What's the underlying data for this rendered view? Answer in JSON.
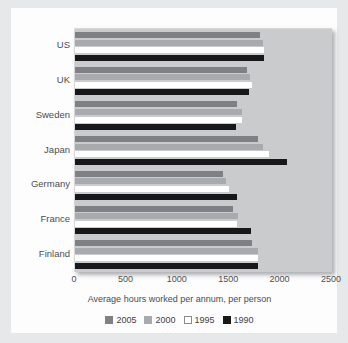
{
  "chart_data": {
    "type": "bar",
    "orientation": "horizontal",
    "title": "",
    "xlabel": "Average hours worked per annum, per person",
    "ylabel": "",
    "xlim": [
      0,
      2500
    ],
    "xticks": [
      0,
      500,
      1000,
      1500,
      2000,
      2500
    ],
    "xtick_labels": [
      "0",
      "500",
      "1000",
      "1500",
      "2000",
      "2500"
    ],
    "grid": false,
    "legend_position": "bottom",
    "categories": [
      "US",
      "UK",
      "Sweden",
      "Japan",
      "Germany",
      "France",
      "Finland"
    ],
    "series": [
      {
        "name": "2005",
        "color": "#7e8084",
        "values": [
          1800,
          1670,
          1580,
          1780,
          1440,
          1540,
          1720
        ]
      },
      {
        "name": "2000",
        "color": "#a8aaad",
        "values": [
          1830,
          1700,
          1620,
          1830,
          1470,
          1590,
          1780
        ]
      },
      {
        "name": "1995",
        "color": "#ffffff",
        "values": [
          1840,
          1720,
          1620,
          1890,
          1500,
          1580,
          1780
        ]
      },
      {
        "name": "1990",
        "color": "#18181a",
        "values": [
          1840,
          1690,
          1570,
          2060,
          1580,
          1710,
          1780
        ]
      }
    ]
  },
  "legend": {
    "entries": [
      {
        "label": "2005",
        "swatch": "s2005"
      },
      {
        "label": "2000",
        "swatch": "s2000"
      },
      {
        "label": "1995",
        "swatch": "s1995"
      },
      {
        "label": "1990",
        "swatch": "s1990"
      }
    ]
  }
}
